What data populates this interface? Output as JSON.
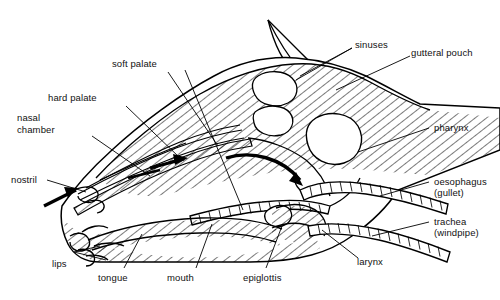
{
  "figure": {
    "style": {
      "line_color": "#000000",
      "fill_color": "#ffffff",
      "hatch_color": "#000000",
      "background": "#ffffff",
      "text_color": "#111111"
    }
  },
  "labels": {
    "soft_palate": "soft palate",
    "hard_palate": "hard palate",
    "nasal_chamber_l1": "nasal",
    "nasal_chamber_l2": "chamber",
    "nostril": "nostril",
    "lips": "lips",
    "tongue": "tongue",
    "mouth": "mouth",
    "epiglottis": "epiglottis",
    "larynx": "larynx",
    "sinuses": "sinuses",
    "gutteral_pouch": "gutteral pouch",
    "pharynx": "pharynx",
    "oesophagus_l1": "oesophagus",
    "oesophagus_l2": "(gullet)",
    "trachea_l1": "trachea",
    "trachea_l2": "(windpipe)"
  },
  "structures": [
    {
      "name": "ear",
      "kind": "outline"
    },
    {
      "name": "head-outline",
      "kind": "outline"
    },
    {
      "name": "hatched-tissue",
      "kind": "hatch-fill"
    },
    {
      "name": "frontal-sinus-cavity",
      "kind": "cavity"
    },
    {
      "name": "maxillary-sinus-cavity",
      "kind": "cavity"
    },
    {
      "name": "guttural-pouch-cavity",
      "kind": "cavity"
    },
    {
      "name": "nasal-turbinates",
      "kind": "scroll-lines"
    },
    {
      "name": "hard-palate-band",
      "kind": "band"
    },
    {
      "name": "soft-palate-band",
      "kind": "band"
    },
    {
      "name": "tongue-body",
      "kind": "hatch-fill"
    },
    {
      "name": "epiglottis-flap",
      "kind": "outline"
    },
    {
      "name": "larynx-body",
      "kind": "hatch-fill"
    },
    {
      "name": "trachea-tube",
      "kind": "ringed-tube"
    },
    {
      "name": "oesophagus-tube",
      "kind": "ringed-tube"
    },
    {
      "name": "airflow-arrow-nostril",
      "kind": "arrow"
    },
    {
      "name": "airflow-arrow-nasal",
      "kind": "arrow"
    },
    {
      "name": "airflow-arrow-pharynx",
      "kind": "curved-arrow"
    }
  ]
}
